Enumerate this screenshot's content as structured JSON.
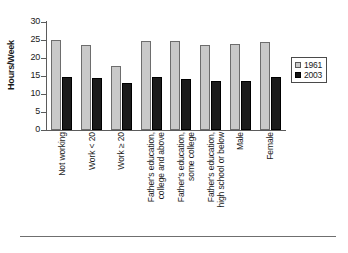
{
  "chart_data": {
    "type": "bar",
    "title": "",
    "xlabel": "",
    "ylabel": "Hours/Week",
    "ylim": [
      0,
      30
    ],
    "yticks": [
      0,
      5,
      10,
      15,
      20,
      25,
      30
    ],
    "grid": false,
    "legend_position": "right",
    "categories": [
      "Not working",
      "Work < 20",
      "Work ≥ 20",
      "Father's education, college and above",
      "Father's education, some college",
      "Father's education, high school or below",
      "Male",
      "Female"
    ],
    "category_lines": [
      [
        "Not working"
      ],
      [
        "Work < 20"
      ],
      [
        "Work ≥ 20"
      ],
      [
        "Father's education,",
        "college and above"
      ],
      [
        "Father's education,",
        "some college"
      ],
      [
        "Father's education,",
        "high school or below"
      ],
      [
        "Male"
      ],
      [
        "Female"
      ]
    ],
    "series": [
      {
        "name": "1961",
        "color": "#c9c9c9",
        "values": [
          25.0,
          23.5,
          17.8,
          24.8,
          24.7,
          23.7,
          24.0,
          24.5
        ]
      },
      {
        "name": "2003",
        "color": "#1b1b1b",
        "values": [
          14.7,
          14.4,
          13.1,
          14.8,
          14.3,
          13.6,
          13.6,
          14.7
        ]
      }
    ]
  },
  "legend": {
    "entries": [
      {
        "label": "1961"
      },
      {
        "label": "2003"
      }
    ]
  }
}
